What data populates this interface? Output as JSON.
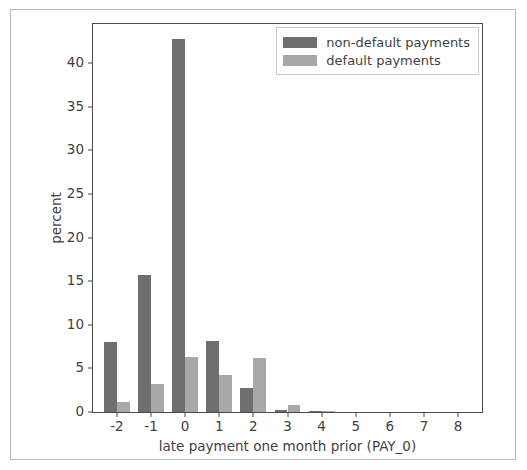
{
  "chart_data": {
    "type": "bar",
    "title": "",
    "xlabel": "late payment one month prior (PAY_0)",
    "ylabel": "percent",
    "categories": [
      "-2",
      "-1",
      "0",
      "1",
      "2",
      "3",
      "4",
      "5",
      "6",
      "7",
      "8"
    ],
    "xticks": [
      "-2",
      "-1",
      "0",
      "1",
      "2",
      "3",
      "4",
      "5",
      "6",
      "7",
      "8"
    ],
    "yticks": [
      "0",
      "5",
      "10",
      "15",
      "20",
      "25",
      "30",
      "35",
      "40"
    ],
    "ytick_values": [
      0,
      5,
      10,
      15,
      20,
      25,
      30,
      35,
      40
    ],
    "xlim": [
      -2.7,
      8.7
    ],
    "ylim": [
      0,
      44.5
    ],
    "grid": false,
    "legend_position": "upper right",
    "series": [
      {
        "name": "non-default payments",
        "color": "#6e6e6e",
        "values": [
          8.0,
          15.7,
          42.8,
          8.2,
          2.8,
          0.2,
          0.05,
          0.0,
          0.0,
          0.0,
          0.0
        ]
      },
      {
        "name": "default payments",
        "color": "#a8a8a8",
        "values": [
          1.2,
          3.2,
          6.35,
          4.2,
          6.2,
          0.85,
          0.1,
          0.0,
          0.0,
          0.0,
          0.0
        ]
      }
    ]
  },
  "figure": {
    "background": "#ffffff",
    "border_color": "#b9b9b9",
    "axis_color": "#4a4a4a",
    "text_color": "#3f3f3f"
  }
}
